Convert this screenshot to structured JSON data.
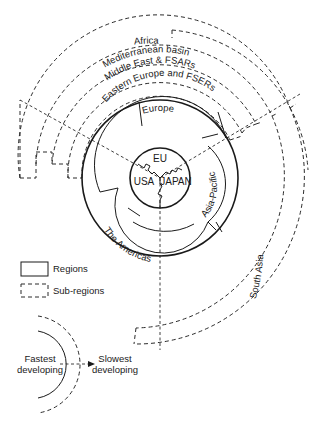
{
  "diagram": {
    "core": {
      "labels": [
        "EU",
        "USA",
        "JAPAN"
      ]
    },
    "regions": {
      "europe": "Europe",
      "asia_pacific": "Asia-Pacific",
      "americas": "The Americas"
    },
    "sub_regions": {
      "eastern_europe": "Eastern Europe and FSERs",
      "middle_east": "Middle East & FSARs",
      "mediterranean": "Mediterranean basin",
      "africa": "Africa",
      "south_asia": "South Asia"
    },
    "legend": {
      "regions_label": "Regions",
      "subregions_label": "Sub-regions"
    },
    "development_axis": {
      "fastest": "Fastest developing",
      "fastest_line1": "Fastest",
      "fastest_line2": "developing",
      "slowest": "Slowest developing",
      "slowest_line1": "Slowest",
      "slowest_line2": "developing"
    },
    "colors": {
      "line": "#1a1a1a",
      "background": "#ffffff"
    }
  }
}
